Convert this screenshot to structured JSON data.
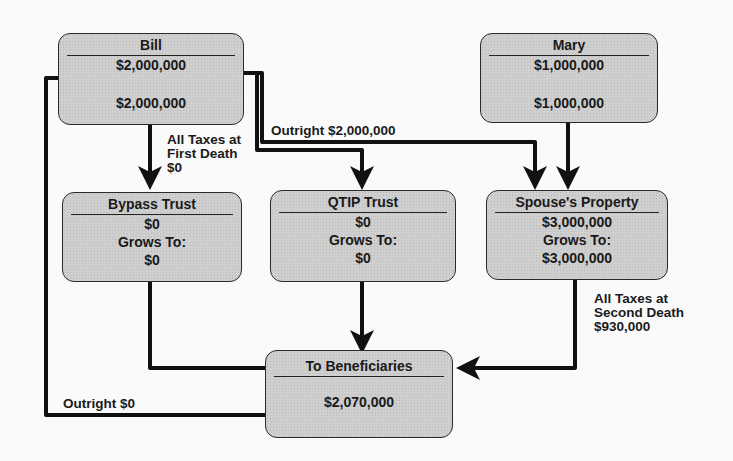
{
  "diagram": {
    "nodes": {
      "bill": {
        "title": "Bill",
        "value": "$2,000,000",
        "value2": "$2,000,000"
      },
      "mary": {
        "title": "Mary",
        "value": "$1,000,000",
        "value2": "$1,000,000"
      },
      "bypass": {
        "title": "Bypass Trust",
        "value": "$0",
        "grows_label": "Grows To:",
        "grows_value": "$0"
      },
      "qtip": {
        "title": "QTIP Trust",
        "value": "$0",
        "grows_label": "Grows To:",
        "grows_value": "$0"
      },
      "spouse": {
        "title": "Spouse's Property",
        "value": "$3,000,000",
        "grows_label": "Grows To:",
        "grows_value": "$3,000,000"
      },
      "beneficiaries": {
        "title": "To Beneficiaries",
        "value": "$2,070,000"
      }
    },
    "labels": {
      "first_death": [
        "All Taxes at",
        "First Death",
        "$0"
      ],
      "outright_spouse": "Outright $2,000,000",
      "second_death": [
        "All Taxes at",
        "Second Death",
        "$930,000"
      ],
      "outright_zero": "Outright $0"
    }
  }
}
